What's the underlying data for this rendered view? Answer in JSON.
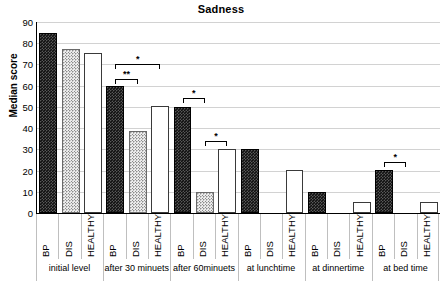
{
  "chart_data": {
    "type": "bar",
    "title": "Sadness",
    "xlabel": "",
    "ylabel": "Median score",
    "ylim": [
      0,
      90
    ],
    "yticks": [
      0,
      10,
      20,
      30,
      40,
      50,
      60,
      70,
      80,
      90
    ],
    "grid": true,
    "legend": "none",
    "categories": [
      "initial level",
      "after 30 minuets",
      "after 60minuets",
      "at lunchtime",
      "at dinnertime",
      "at bed time"
    ],
    "subcategories": [
      "BP",
      "DIS",
      "HEALTHY"
    ],
    "series": [
      {
        "name": "BP",
        "values": [
          85,
          60,
          50,
          30,
          10,
          20.5
        ]
      },
      {
        "name": "DIS",
        "values": [
          77.5,
          38.5,
          10,
          0,
          0,
          0
        ]
      },
      {
        "name": "HEALTHY",
        "values": [
          75.5,
          50.5,
          30,
          20.5,
          5,
          5
        ]
      }
    ],
    "annotations": [
      {
        "group": "after 30 minuets",
        "from": "BP",
        "to": "HEALTHY",
        "label": "*",
        "y": 72
      },
      {
        "group": "after 30 minuets",
        "from": "BP",
        "to": "DIS",
        "label": "**",
        "y": 65
      },
      {
        "group": "after 60minuets",
        "from": "BP",
        "to": "DIS",
        "label": "*",
        "y": 56
      },
      {
        "group": "after 60minuets",
        "from": "DIS",
        "to": "HEALTHY",
        "label": "*",
        "y": 36
      },
      {
        "group": "at bed time",
        "from": "BP",
        "to": "DIS",
        "label": "*",
        "y": 26
      }
    ]
  }
}
